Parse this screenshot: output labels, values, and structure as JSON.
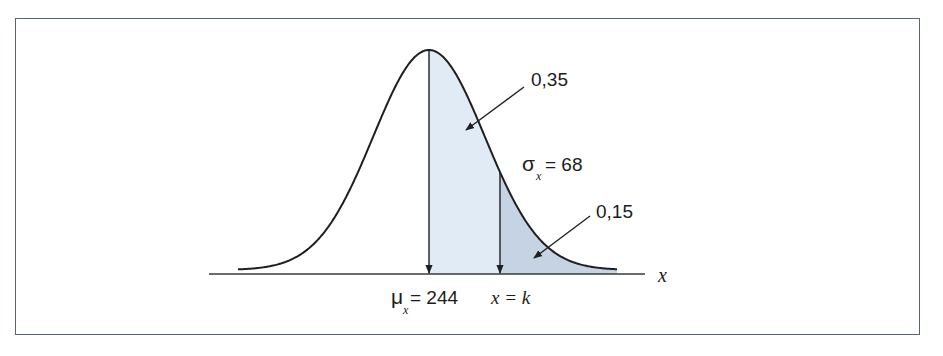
{
  "chart_data": {
    "type": "area",
    "title": "",
    "distribution": "normal",
    "mean": 244,
    "std_dev": 68,
    "xlabel": "x",
    "ylabel": "",
    "grid": false,
    "legend": null,
    "regions": [
      {
        "name": "mean-to-k",
        "from": "μx = 244",
        "to": "x = k",
        "probability": 0.35,
        "label": "0,35",
        "color": "#e1ebf5"
      },
      {
        "name": "beyond-k",
        "from": "x = k",
        "to": "+∞",
        "probability": 0.15,
        "label": "0,15",
        "color": "#c5d3e2"
      }
    ],
    "annotations": {
      "mean_label_prefix": "μ",
      "mean_label_sub": "x",
      "mean_label_suffix": "= 244",
      "k_label": "x = k",
      "sigma_label_prefix": "σ",
      "sigma_label_sub": "x",
      "sigma_label_suffix": "= 68",
      "area_1": "0,35",
      "area_2": "0,15",
      "axis_label": "x"
    }
  },
  "colors": {
    "frame_border": "#5a6478",
    "curve": "#1f1f1f",
    "region_light": "#e1ebf5",
    "region_dark": "#c5d3e2"
  }
}
